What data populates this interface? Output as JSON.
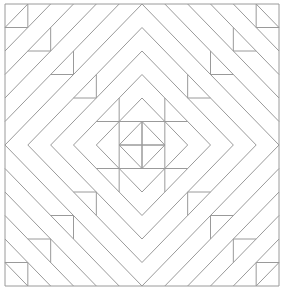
{
  "diagram": {
    "type": "quilt-block-line-drawing",
    "stroke_color": "#9a9a9a",
    "background_color": "#ffffff",
    "bounds": {
      "x0": 5,
      "y0": 4,
      "x1": 279,
      "y1": 286
    },
    "grid_cells": 12
  }
}
